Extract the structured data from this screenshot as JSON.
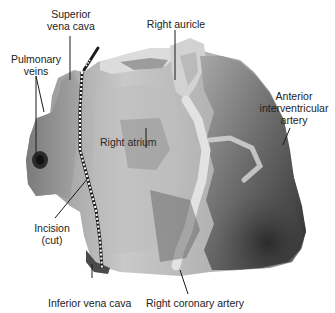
{
  "figure": {
    "labels": {
      "superior_vena_cava": [
        "Superior",
        "vena cava"
      ],
      "right_auricle": "Right auricle",
      "pulmonary_veins": [
        "Pulmonary",
        "veins"
      ],
      "anterior_interventricular_artery": [
        "Anterior",
        "interventricular",
        "artery"
      ],
      "right_atrium": "Right atrium",
      "incision": [
        "Incision",
        "(cut)"
      ],
      "inferior_vena_cava": "Inferior vena cava",
      "right_coronary_artery": "Right coronary artery"
    },
    "colors": {
      "background": "#ffffff",
      "text": "#222222",
      "leader_line": "#1a1a1a",
      "tissue_light": "#d8d8d8",
      "tissue_mid": "#9a9a9a",
      "tissue_dark": "#3a3a3a",
      "incision_dots": "#ffffff"
    }
  }
}
